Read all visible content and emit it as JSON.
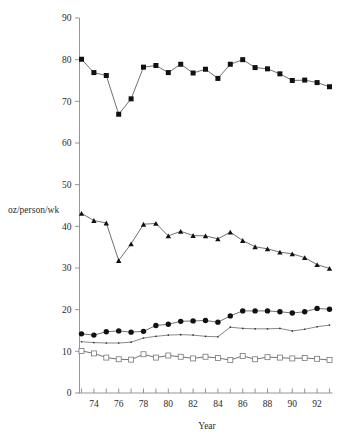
{
  "chart_data": {
    "type": "line",
    "title": "",
    "subtitle": "",
    "xlabel": "Year",
    "ylabel": "oz/person/wk",
    "xlim": [
      73,
      93
    ],
    "ylim": [
      0,
      90
    ],
    "grid": false,
    "legend_position": "none",
    "x_tick_labels": [
      "74",
      "76",
      "78",
      "80",
      "82",
      "84",
      "86",
      "88",
      "90",
      "92"
    ],
    "x_tick_values": [
      74,
      76,
      78,
      80,
      82,
      84,
      86,
      88,
      90,
      92
    ],
    "x_minor_tick_values": [
      73,
      74,
      75,
      76,
      77,
      78,
      79,
      80,
      81,
      82,
      83,
      84,
      85,
      86,
      87,
      88,
      89,
      90,
      91,
      92,
      93
    ],
    "y_tick_labels": [
      "0",
      "10",
      "20",
      "30",
      "40",
      "50",
      "60",
      "70",
      "80",
      "90"
    ],
    "y_tick_values": [
      0,
      10,
      20,
      30,
      40,
      50,
      60,
      70,
      80,
      90
    ],
    "x": [
      73,
      74,
      75,
      76,
      77,
      78,
      79,
      80,
      81,
      82,
      83,
      84,
      85,
      86,
      87,
      88,
      89,
      90,
      91,
      92,
      93
    ],
    "series": [
      {
        "name": "series-filled-square",
        "marker": "filled-square",
        "values": [
          80.1,
          76.9,
          76.2,
          66.9,
          70.6,
          78.2,
          78.6,
          76.9,
          78.9,
          76.8,
          77.7,
          75.5,
          78.9,
          80.0,
          78.1,
          77.8,
          76.6,
          75.0,
          75.1,
          74.5,
          73.5
        ]
      },
      {
        "name": "series-filled-triangle",
        "marker": "filled-triangle",
        "values": [
          43.1,
          41.4,
          40.8,
          31.8,
          35.8,
          40.5,
          40.7,
          37.7,
          38.8,
          37.8,
          37.7,
          37.0,
          38.6,
          36.6,
          35.1,
          34.6,
          33.8,
          33.4,
          32.5,
          30.8,
          29.9
        ]
      },
      {
        "name": "series-filled-circle",
        "marker": "filled-circle",
        "values": [
          14.2,
          13.9,
          14.7,
          14.9,
          14.6,
          14.8,
          16.2,
          16.5,
          17.2,
          17.3,
          17.4,
          17.0,
          18.5,
          19.7,
          19.7,
          19.7,
          19.5,
          19.2,
          19.5,
          20.3,
          20.1
        ]
      },
      {
        "name": "series-thin-dot",
        "marker": "tiny-dot",
        "values": [
          12.3,
          12.1,
          12.0,
          12.0,
          12.2,
          13.2,
          13.6,
          13.9,
          14.0,
          13.9,
          13.6,
          13.5,
          15.8,
          15.5,
          15.4,
          15.4,
          15.5,
          14.9,
          15.3,
          15.9,
          16.3
        ]
      },
      {
        "name": "series-open-square",
        "marker": "open-square",
        "values": [
          10.1,
          9.5,
          8.5,
          8.1,
          8.0,
          9.3,
          8.5,
          9.0,
          8.7,
          8.3,
          8.7,
          8.4,
          7.9,
          8.9,
          8.1,
          8.6,
          8.5,
          8.3,
          8.4,
          8.2,
          7.9
        ]
      }
    ]
  },
  "axes": {
    "y_label_text": "oz/person/wk",
    "x_label_text": "Year"
  }
}
